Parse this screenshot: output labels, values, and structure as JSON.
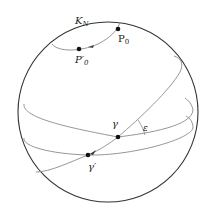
{
  "diagram": {
    "type": "celestial-sphere",
    "colors": {
      "background": "#ffffff",
      "sphere_outline": "#333333",
      "curves": "#8a8a8a",
      "points": "#111111",
      "text": "#222222"
    },
    "labels": {
      "pole_circle": "K",
      "pole_circle_sub": "N",
      "p0": "P",
      "p0_sub": "0",
      "p0_prime": "P′",
      "p0_prime_sub": "0",
      "gamma": "γ",
      "gamma_prime": "γ′",
      "epsilon": "ε"
    },
    "points": [
      {
        "id": "P0",
        "x": 118,
        "y": 29
      },
      {
        "id": "P0_prime",
        "x": 79,
        "y": 49
      },
      {
        "id": "gamma",
        "x": 118,
        "y": 137
      },
      {
        "id": "gamma_prime",
        "x": 88,
        "y": 155
      }
    ]
  }
}
